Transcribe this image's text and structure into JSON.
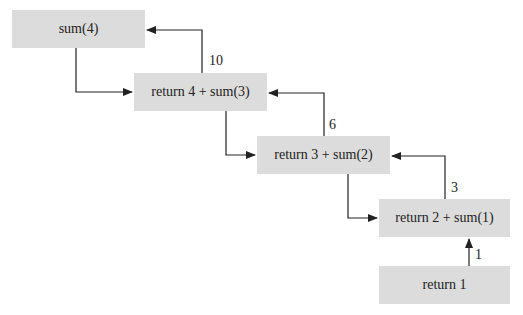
{
  "colors": {
    "box_fill": "#dcdcdc",
    "line": "#222222",
    "text": "#222222"
  },
  "boxes": [
    {
      "id": "sum4",
      "label": "sum(4)"
    },
    {
      "id": "ret4",
      "label": "return 4 + sum(3)"
    },
    {
      "id": "ret3",
      "label": "return 3 + sum(2)"
    },
    {
      "id": "ret2",
      "label": "return 2 + sum(1)"
    },
    {
      "id": "ret1",
      "label": "return 1"
    }
  ],
  "return_values": [
    {
      "from": "ret4",
      "to": "sum4",
      "label": "10"
    },
    {
      "from": "ret3",
      "to": "ret4",
      "label": "6"
    },
    {
      "from": "ret2",
      "to": "ret3",
      "label": "3"
    },
    {
      "from": "ret1",
      "to": "ret2",
      "label": "1"
    }
  ]
}
